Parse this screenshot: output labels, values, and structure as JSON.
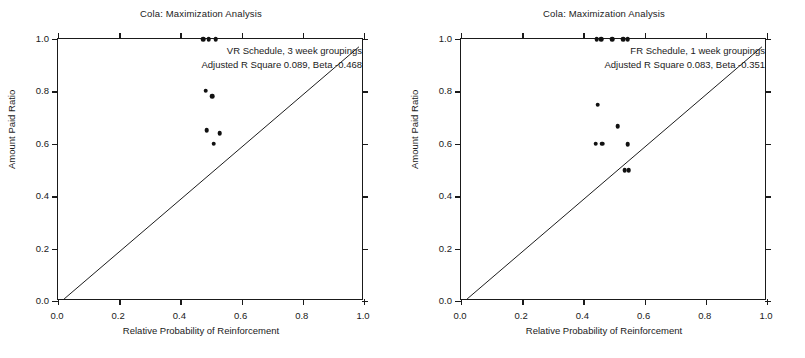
{
  "figure": {
    "panel_count": 2,
    "background": "#ffffff",
    "marker_color": "#111111",
    "axis_color": "#1a1a1a"
  },
  "chart_data": [
    {
      "type": "scatter",
      "panel": "left",
      "title": "Cola: Maximization Analysis",
      "xlabel": "Relative Probability of Reinforcement",
      "ylabel": "Amount Paid Ratio",
      "xlim": [
        0.0,
        1.0
      ],
      "ylim": [
        0.0,
        1.0
      ],
      "xticks": [
        0.0,
        0.2,
        0.4,
        0.6,
        0.8,
        1.0
      ],
      "yticks": [
        0.0,
        0.2,
        0.4,
        0.6,
        0.8,
        1.0
      ],
      "xticklabels": [
        "0.0",
        "0.2",
        "0.4",
        "0.6",
        "0.8",
        "1.0"
      ],
      "yticklabels": [
        "0.0",
        "0.2",
        "0.4",
        "0.6",
        "0.8",
        "1.0"
      ],
      "grid": false,
      "legend": null,
      "annotation_line1": "VR Schedule, 3 week groupings",
      "annotation_line2": "Adjusted R Square 0.089, Beta -0.468",
      "schedule": "VR Schedule",
      "grouping": "3 week groupings",
      "adjusted_r_square": 0.089,
      "beta": -0.468,
      "reference_line": {
        "kind": "identity",
        "label": "y = x",
        "x": [
          0.02,
          0.99
        ],
        "y": [
          0.0,
          0.97
        ]
      },
      "points": [
        {
          "x": 0.475,
          "y": 1.0
        },
        {
          "x": 0.492,
          "y": 1.0
        },
        {
          "x": 0.515,
          "y": 1.0
        },
        {
          "x": 0.483,
          "y": 0.803
        },
        {
          "x": 0.503,
          "y": 0.782
        },
        {
          "x": 0.486,
          "y": 0.651
        },
        {
          "x": 0.528,
          "y": 0.64
        },
        {
          "x": 0.509,
          "y": 0.6
        }
      ]
    },
    {
      "type": "scatter",
      "panel": "right",
      "title": "Cola: Maximization Analysis",
      "xlabel": "Relative Probability of Reinforcement",
      "ylabel": "Amount Paid Ratio",
      "xlim": [
        0.0,
        1.0
      ],
      "ylim": [
        0.0,
        1.0
      ],
      "xticks": [
        0.0,
        0.2,
        0.4,
        0.6,
        0.8,
        1.0
      ],
      "yticks": [
        0.0,
        0.2,
        0.4,
        0.6,
        0.8,
        1.0
      ],
      "xticklabels": [
        "0.0",
        "0.2",
        "0.4",
        "0.6",
        "0.8",
        "1.0"
      ],
      "yticklabels": [
        "0.0",
        "0.2",
        "0.4",
        "0.6",
        "0.8",
        "1.0"
      ],
      "grid": false,
      "legend": null,
      "annotation_line1": "FR Schedule, 1 week groupings",
      "annotation_line2": "Adjusted R Square 0.083, Beta -0.351",
      "schedule": "FR Schedule",
      "grouping": "1 week groupings",
      "adjusted_r_square": 0.083,
      "beta": -0.351,
      "reference_line": {
        "kind": "identity",
        "label": "y = x",
        "x": [
          0.02,
          0.99
        ],
        "y": [
          0.0,
          0.97
        ]
      },
      "points": [
        {
          "x": 0.443,
          "y": 1.0
        },
        {
          "x": 0.458,
          "y": 1.0
        },
        {
          "x": 0.495,
          "y": 1.0
        },
        {
          "x": 0.53,
          "y": 1.0
        },
        {
          "x": 0.545,
          "y": 1.0
        },
        {
          "x": 0.447,
          "y": 0.75
        },
        {
          "x": 0.512,
          "y": 0.667
        },
        {
          "x": 0.44,
          "y": 0.6
        },
        {
          "x": 0.462,
          "y": 0.6
        },
        {
          "x": 0.545,
          "y": 0.598
        },
        {
          "x": 0.535,
          "y": 0.5
        },
        {
          "x": 0.548,
          "y": 0.5
        }
      ]
    }
  ]
}
